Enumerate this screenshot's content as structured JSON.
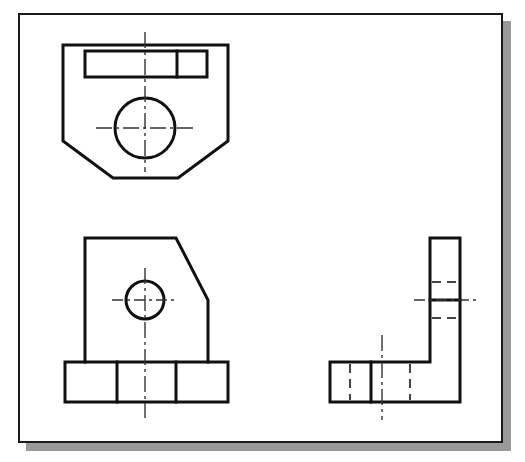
{
  "document": {
    "title": "Three-View Orthographic Engineering Drawing",
    "sheet_label": "",
    "background_color": "#ffffff",
    "paper_color": "#ffffff",
    "border_color": "#1a1a1a",
    "shadow_color": "#9a9a9a",
    "visible_line_color": "#111111",
    "hidden_line_color": "#444444",
    "center_line_color": "#333333"
  },
  "sheet": {
    "x": 18,
    "y": 13,
    "width": 485,
    "height": 430,
    "border_width": 2,
    "shadow_offset_x": 8,
    "shadow_offset_y": 8
  },
  "drawing_data": {
    "type": "orthographic-projection",
    "projection": "third-angle",
    "view_count": 3,
    "units": "px",
    "views": [
      {
        "id": "top-view",
        "name": "Top View",
        "position": "upper-left",
        "bounds": {
          "x": 63,
          "y": 45,
          "width": 165,
          "height": 133
        },
        "outline_type": "chamfered-rectangle",
        "outline_points": "63,45 228,45 228,141 178,178 113,178 63,141",
        "features": [
          {
            "id": "top-slot",
            "name": "rectangular slot",
            "type": "rectangle",
            "x": 85,
            "y": 51,
            "width": 122,
            "height": 26
          },
          {
            "id": "top-slot-divider",
            "name": "slot divider line",
            "type": "line",
            "x1": 177,
            "y1": 51,
            "x2": 177,
            "y2": 77
          },
          {
            "id": "top-hole",
            "name": "through hole",
            "type": "circle",
            "cx": 145,
            "cy": 128,
            "r": 30
          }
        ],
        "center_lines": [
          {
            "id": "top-vertical-center",
            "orientation": "vertical",
            "x1": 145,
            "y1": 32,
            "x2": 145,
            "y2": 172
          },
          {
            "id": "top-horizontal-center",
            "orientation": "horizontal",
            "x1": 96,
            "y1": 128,
            "x2": 193,
            "y2": 128
          }
        ]
      },
      {
        "id": "front-view",
        "name": "Front View",
        "position": "lower-left",
        "bounds": {
          "x": 65,
          "y": 238,
          "width": 163,
          "height": 164
        },
        "outline_type": "chamfered-body-with-base",
        "body_points": "85,362 85,238 176,238 208,300 208,362",
        "features": [
          {
            "id": "front-base-plate",
            "name": "base plate",
            "type": "rectangle",
            "x": 65,
            "y": 362,
            "width": 163,
            "height": 40
          },
          {
            "id": "front-base-divider-left",
            "name": "base divider line left",
            "type": "line",
            "x1": 117,
            "y1": 362,
            "x2": 117,
            "y2": 402
          },
          {
            "id": "front-base-divider-right",
            "name": "base divider line right",
            "type": "line",
            "x1": 176,
            "y1": 362,
            "x2": 176,
            "y2": 402
          },
          {
            "id": "front-hole",
            "name": "through hole",
            "type": "circle",
            "cx": 145,
            "cy": 300,
            "r": 19
          }
        ],
        "center_lines": [
          {
            "id": "front-vertical-center",
            "orientation": "vertical",
            "x1": 145,
            "y1": 268,
            "x2": 145,
            "y2": 418
          },
          {
            "id": "front-horizontal-center",
            "orientation": "horizontal",
            "x1": 112,
            "y1": 300,
            "x2": 178,
            "y2": 300
          }
        ]
      },
      {
        "id": "right-side-view",
        "name": "Right Side View",
        "position": "lower-right",
        "bounds": {
          "x": 330,
          "y": 238,
          "width": 130,
          "height": 164
        },
        "outline_type": "L-shape",
        "outline_points": "330,362 430,362 430,238 460,238 460,402 330,402",
        "features": [
          {
            "id": "side-base-divider",
            "name": "base divider line",
            "type": "line",
            "x1": 371,
            "y1": 362,
            "x2": 371,
            "y2": 402
          },
          {
            "id": "side-leg-step",
            "name": "vertical leg step line",
            "type": "line",
            "x1": 430,
            "y1": 300,
            "x2": 460,
            "y2": 300
          }
        ],
        "hidden_lines": [
          {
            "id": "side-hidden-base-left",
            "orientation": "vertical",
            "x1": 350,
            "y1": 364,
            "x2": 350,
            "y2": 400
          },
          {
            "id": "side-hidden-base-right",
            "orientation": "vertical",
            "x1": 410,
            "y1": 364,
            "x2": 410,
            "y2": 400
          },
          {
            "id": "side-hidden-leg-upper",
            "orientation": "horizontal",
            "x1": 432,
            "y1": 282,
            "x2": 458,
            "y2": 282
          },
          {
            "id": "side-hidden-leg-lower",
            "orientation": "horizontal",
            "x1": 432,
            "y1": 318,
            "x2": 458,
            "y2": 318
          }
        ],
        "center_lines": [
          {
            "id": "side-vertical-center",
            "orientation": "vertical",
            "x1": 382,
            "y1": 335,
            "x2": 382,
            "y2": 420
          },
          {
            "id": "side-horizontal-center",
            "orientation": "horizontal",
            "x1": 414,
            "y1": 300,
            "x2": 476,
            "y2": 300
          }
        ]
      }
    ]
  }
}
